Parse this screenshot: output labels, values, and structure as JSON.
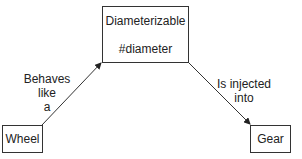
{
  "nodes": {
    "top": {
      "title": "Diameterizable",
      "method": "#diameter"
    },
    "left": {
      "label": "Wheel"
    },
    "right": {
      "label": "Gear"
    }
  },
  "edges": {
    "left_to_top": {
      "line1": "Behaves",
      "line2": "like",
      "line3": "a"
    },
    "top_to_right": {
      "line1": "Is injected",
      "line2": "into"
    }
  }
}
